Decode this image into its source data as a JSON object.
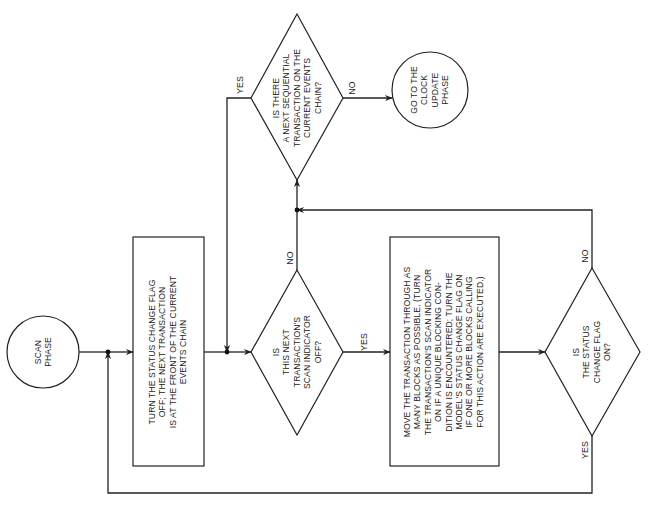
{
  "diagram": {
    "orientation": "rotated-90-ccw",
    "nodes": {
      "start": {
        "type": "terminal",
        "text": "SCAN\nPHASE"
      },
      "reset_flag": {
        "type": "process",
        "text": "TURN THE STATUS CHANGE FLAG\nOFF; THE NEXT TRANSACTION\nIS AT THE FRONT OF THE CURRENT\nEVENTS CHAIN"
      },
      "scan_indicator": {
        "type": "decision",
        "text": "IS\nTHIS NEXT\nTRANSACTION'S\nSCAN INDICATOR\nOFF?"
      },
      "move_transaction": {
        "type": "process",
        "text": "MOVE THE TRANSACTION THROUGH AS\nMANY BLOCKS AS POSSIBLE. (TURN\nTHE TRANSACTION'S SCAN INDICATOR\nON IF A UNIQUE BLOCKING CON-\nDITION IS ENCOUNTERED; TURN THE\nMODEL'S STATUS CHANGE FLAG ON\nIF ONE OR MORE BLOCKS CALLING\nFOR THIS ACTION ARE EXECUTED.)"
      },
      "status_flag": {
        "type": "decision",
        "text": "IS\nTHE STATUS\nCHANGE FLAG\nON?"
      },
      "next_sequential": {
        "type": "decision",
        "text": "IS THERE\nA NEXT SEQUENTIAL\nTRANSACTION ON THE\nCURRENT EVENTS\nCHAIN?"
      },
      "clock_update": {
        "type": "terminal",
        "text": "GO TO THE\nCLOCK\nUPDATE\nPHASE"
      }
    },
    "edges": {
      "scan_yes": "YES",
      "scan_no": "NO",
      "status_yes": "YES",
      "status_no": "NO",
      "next_yes": "YES",
      "next_no": "NO"
    },
    "colors": {
      "line": "#222222",
      "background": "#ffffff"
    }
  }
}
